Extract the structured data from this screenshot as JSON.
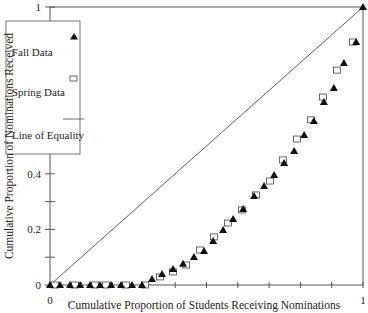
{
  "chart_data": {
    "type": "scatter",
    "title": "",
    "xlabel": "Cumulative Proportion of Students Receiving Nominations",
    "ylabel": "Cumulative Proportion of Nominations Received",
    "xlim": [
      0,
      1
    ],
    "ylim": [
      0,
      1
    ],
    "x_ticks": [
      0,
      0.1,
      0.2,
      0.3,
      0.4,
      0.5,
      0.6,
      0.7,
      0.8,
      0.9,
      1
    ],
    "x_tick_labels": [
      "0",
      "",
      "",
      "",
      "",
      "",
      "",
      "",
      "",
      "",
      "1"
    ],
    "y_ticks": [
      0,
      0.1,
      0.2,
      0.3,
      0.4,
      0.5,
      0.6,
      0.7,
      0.8,
      0.9,
      1
    ],
    "y_tick_labels": [
      "0",
      "",
      "0.2",
      "",
      "0.4",
      "",
      "0.6",
      "",
      "0.8",
      "",
      "1"
    ],
    "grid": false,
    "legend_position": "upper-left-inside",
    "legend": [
      "Fall Data",
      "Spring Data",
      "Line of Equality"
    ],
    "series": [
      {
        "name": "Fall Data",
        "marker": "filled-triangle",
        "color": "#111111",
        "x": [
          0,
          0.032,
          0.064,
          0.096,
          0.128,
          0.16,
          0.195,
          0.227,
          0.262,
          0.294,
          0.326,
          0.358,
          0.393,
          0.425,
          0.46,
          0.492,
          0.521,
          0.553,
          0.585,
          0.617,
          0.652,
          0.684,
          0.716,
          0.748,
          0.78,
          0.812,
          0.843,
          0.875,
          0.907,
          0.939,
          0.978,
          1
        ],
        "y": [
          0,
          0,
          0,
          0,
          0,
          0,
          0,
          0,
          0,
          0,
          0.022,
          0.04,
          0.058,
          0.076,
          0.101,
          0.122,
          0.158,
          0.198,
          0.237,
          0.273,
          0.32,
          0.356,
          0.396,
          0.439,
          0.482,
          0.54,
          0.59,
          0.658,
          0.709,
          0.799,
          0.874,
          1
        ]
      },
      {
        "name": "Spring Data",
        "marker": "open-square",
        "color": "#111111",
        "x": [
          0.016,
          0.08,
          0.144,
          0.179,
          0.243,
          0.304,
          0.351,
          0.393,
          0.435,
          0.479,
          0.524,
          0.569,
          0.613,
          0.658,
          0.703,
          0.744,
          0.789,
          0.834,
          0.872,
          0.917,
          0.968
        ],
        "y": [
          0,
          0,
          0,
          0,
          0,
          0,
          0.029,
          0.047,
          0.072,
          0.126,
          0.173,
          0.223,
          0.27,
          0.324,
          0.374,
          0.45,
          0.525,
          0.594,
          0.676,
          0.773,
          0.874
        ]
      },
      {
        "name": "Line of Equality",
        "marker": "line",
        "color": "#333333",
        "x": [
          0,
          1
        ],
        "y": [
          0,
          1
        ]
      }
    ]
  }
}
